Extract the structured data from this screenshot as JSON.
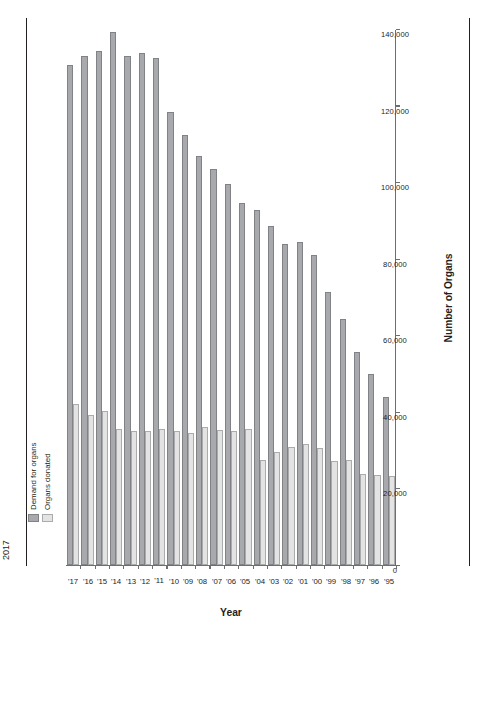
{
  "caption": {
    "exhibit_number": "EXHIBIT 29.1",
    "text": "Demand for Organs and Total Number of Organs Donated, 1995–2017"
  },
  "legend": {
    "items": [
      {
        "label": "Demand for organs",
        "color": "#a7a9ac"
      },
      {
        "label": "Organs donated",
        "color": "#e3e3e4"
      }
    ]
  },
  "axes": {
    "value_title": "Number of Organs",
    "category_title": "Year",
    "value_ticks": [
      "0",
      "20,000",
      "40,000",
      "60,000",
      "80,000",
      "100,000",
      "120,000",
      "140,000"
    ]
  },
  "chart_data": {
    "type": "bar",
    "orientation": "horizontal",
    "title": "Demand for Organs and Total Number of Organs Donated, 1995–2017",
    "xlabel": "Number of Organs",
    "ylabel": "Year",
    "xlim": [
      0,
      140000
    ],
    "grid": false,
    "legend_position": "top-left",
    "categories": [
      "'95",
      "'96",
      "'97",
      "'98",
      "'99",
      "'00",
      "'01",
      "'02",
      "'03",
      "'04",
      "'05",
      "'06",
      "'07",
      "'08",
      "'09",
      "'10",
      "'11",
      "'12",
      "'13",
      "'14",
      "'15",
      "'16",
      "'17"
    ],
    "series": [
      {
        "name": "Demand for organs",
        "color": "#a7a9ac",
        "values": [
          43900,
          50000,
          55700,
          64300,
          71200,
          80900,
          84400,
          83800,
          88500,
          92600,
          94600,
          99500,
          103400,
          106900,
          112400,
          118200,
          132500,
          133700,
          133000,
          139300,
          134300,
          133000,
          130700
        ]
      },
      {
        "name": "Organs donated",
        "color": "#e3e3e4",
        "values": [
          23300,
          23600,
          23800,
          27400,
          27200,
          30500,
          31600,
          30800,
          29500,
          27500,
          35400,
          35100,
          35200,
          36000,
          34600,
          35100,
          35600,
          35000,
          35100,
          35600,
          40300,
          39300,
          42000
        ]
      }
    ]
  }
}
